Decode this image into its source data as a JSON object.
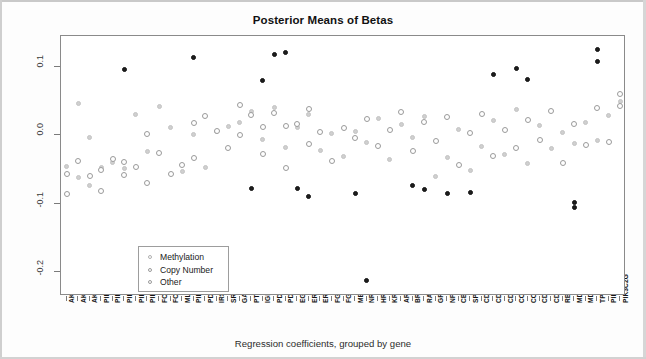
{
  "chart": {
    "title": "Posterior Means of Betas",
    "xlabel": "Regression coefficients, grouped by gene",
    "ylabel": "Posterior means"
  },
  "legend": {
    "items": [
      {
        "label": "Methylation",
        "key": "meth"
      },
      {
        "label": "Copy Number",
        "key": "cn"
      },
      {
        "label": "Other",
        "key": "other"
      }
    ]
  },
  "chart_data": {
    "type": "scatter",
    "title": "Posterior Means of Betas",
    "xlabel": "Regression coefficients, grouped by gene",
    "ylabel": "Posterior means",
    "ylim": [
      -0.235,
      0.145
    ],
    "yticks": [
      0.1,
      0.0,
      -0.1,
      -0.2
    ],
    "ytick_labels": [
      "0.1",
      "0.0",
      "-0.1",
      "-0.2"
    ],
    "grid": false,
    "legend_position": "lower left (inside axes)",
    "categories": [
      "AKT1",
      "AKT2",
      "AKT3",
      "PIK3CA",
      "PIK3CB",
      "PIK3CD",
      "PIK3R1",
      "PIK3R2",
      "FOXO1A",
      "FOXO3A",
      "MLLT7",
      "PIK3CG",
      "PDPK1",
      "IRS1",
      "SRC",
      "GAB1",
      "PTEN",
      "IGF1R",
      "PDGFRA",
      "PDGFRB",
      "EGFR",
      "ERBB2",
      "ERBB3",
      "FGFR1",
      "FGFR2",
      "MET",
      "NRAS",
      "HRAS",
      "KRAS",
      "ARAF",
      "BRAF",
      "RAF1",
      "GRB2",
      "NF1",
      "CBL",
      "SPRY2",
      "CDKN2A",
      "CDKN2C",
      "CDKN2B",
      "CCND1",
      "CCND2",
      "CDK4",
      "CDK6",
      "RB1",
      "MDM2",
      "MDM4",
      "TP53",
      "PIK3C2B",
      "PIK3C2G"
    ],
    "series": [
      {
        "name": "Methylation",
        "marker": "light-gray filled circle",
        "points": [
          {
            "gene": "AKT1",
            "x": 1,
            "y": -0.045
          },
          {
            "gene": "AKT2",
            "x": 2,
            "y": 0.046
          },
          {
            "gene": "AKT2",
            "x": 2,
            "y": -0.062
          },
          {
            "gene": "AKT3",
            "x": 3,
            "y": -0.003
          },
          {
            "gene": "AKT3",
            "x": 3,
            "y": -0.074
          },
          {
            "gene": "PIK3CA",
            "x": 4,
            "y": -0.047
          },
          {
            "gene": "PIK3CB",
            "x": 5,
            "y": -0.04
          },
          {
            "gene": "PIK3CD",
            "x": 6,
            "y": -0.049
          },
          {
            "gene": "PIK3R1",
            "x": 7,
            "y": 0.03
          },
          {
            "gene": "PIK3R2",
            "x": 8,
            "y": -0.024
          },
          {
            "gene": "FOXO1A",
            "x": 9,
            "y": 0.042
          },
          {
            "gene": "FOXO3A",
            "x": 10,
            "y": 0.012
          },
          {
            "gene": "MLLT7",
            "x": 11,
            "y": -0.053
          },
          {
            "gene": "PIK3CG",
            "x": 12,
            "y": 0.001
          },
          {
            "gene": "PDPK1",
            "x": 13,
            "y": -0.047
          },
          {
            "gene": "IRS1",
            "x": 14,
            "y": 0.005
          },
          {
            "gene": "SRC",
            "x": 15,
            "y": 0.013
          },
          {
            "gene": "GAB1",
            "x": 16,
            "y": 0.018
          },
          {
            "gene": "PTEN",
            "x": 17,
            "y": 0.035
          },
          {
            "gene": "IGF1R",
            "x": 18,
            "y": -0.006
          },
          {
            "gene": "PDGFRA",
            "x": 19,
            "y": 0.041
          },
          {
            "gene": "PDGFRB",
            "x": 20,
            "y": -0.018
          },
          {
            "gene": "EGFR",
            "x": 21,
            "y": 0.011
          },
          {
            "gene": "ERBB2",
            "x": 22,
            "y": 0.031
          },
          {
            "gene": "ERBB3",
            "x": 23,
            "y": -0.022
          },
          {
            "gene": "FGFR1",
            "x": 24,
            "y": 0.002
          },
          {
            "gene": "FGFR2",
            "x": 25,
            "y": -0.031
          },
          {
            "gene": "MET",
            "x": 26,
            "y": 0.006
          },
          {
            "gene": "NRAS",
            "x": 27,
            "y": -0.011
          },
          {
            "gene": "HRAS",
            "x": 28,
            "y": 0.024
          },
          {
            "gene": "KRAS",
            "x": 29,
            "y": -0.036
          },
          {
            "gene": "ARAF",
            "x": 30,
            "y": 0.015
          },
          {
            "gene": "BRAF",
            "x": 31,
            "y": -0.004
          },
          {
            "gene": "RAF1",
            "x": 32,
            "y": 0.027
          },
          {
            "gene": "GRB2",
            "x": 33,
            "y": -0.06
          },
          {
            "gene": "NF1",
            "x": 34,
            "y": -0.033
          },
          {
            "gene": "CBL",
            "x": 35,
            "y": 0.009
          },
          {
            "gene": "SPRY2",
            "x": 36,
            "y": -0.051
          },
          {
            "gene": "CDKN2A",
            "x": 37,
            "y": -0.016
          },
          {
            "gene": "CDKN2C",
            "x": 38,
            "y": 0.021
          },
          {
            "gene": "CDKN2B",
            "x": 39,
            "y": -0.028
          },
          {
            "gene": "CCND1",
            "x": 40,
            "y": 0.038
          },
          {
            "gene": "CCND2",
            "x": 41,
            "y": -0.042
          },
          {
            "gene": "CDK4",
            "x": 42,
            "y": 0.014
          },
          {
            "gene": "CDK6",
            "x": 43,
            "y": -0.02
          },
          {
            "gene": "RB1",
            "x": 44,
            "y": 0.004
          },
          {
            "gene": "MDM2",
            "x": 45,
            "y": -0.012
          },
          {
            "gene": "MDM4",
            "x": 46,
            "y": 0.019
          },
          {
            "gene": "TP53",
            "x": 47,
            "y": -0.008
          },
          {
            "gene": "PIK3C2B",
            "x": 48,
            "y": 0.029
          },
          {
            "gene": "PIK3C2G",
            "x": 49,
            "y": 0.049
          }
        ]
      },
      {
        "name": "Copy Number",
        "marker": "open circle with gray ring",
        "points": [
          {
            "gene": "AKT1",
            "x": 1,
            "y": -0.056
          },
          {
            "gene": "AKT1",
            "x": 1,
            "y": -0.086
          },
          {
            "gene": "AKT2",
            "x": 2,
            "y": -0.037
          },
          {
            "gene": "AKT3",
            "x": 3,
            "y": -0.06
          },
          {
            "gene": "PIK3CA",
            "x": 4,
            "y": -0.051
          },
          {
            "gene": "PIK3CA",
            "x": 4,
            "y": -0.081
          },
          {
            "gene": "PIK3CB",
            "x": 5,
            "y": -0.035
          },
          {
            "gene": "PIK3CD",
            "x": 6,
            "y": -0.058
          },
          {
            "gene": "PIK3CD",
            "x": 6,
            "y": -0.039
          },
          {
            "gene": "PIK3R1",
            "x": 7,
            "y": -0.047
          },
          {
            "gene": "PIK3R2",
            "x": 8,
            "y": 0.002
          },
          {
            "gene": "PIK3R2",
            "x": 8,
            "y": -0.07
          },
          {
            "gene": "FOXO1A",
            "x": 9,
            "y": -0.026
          },
          {
            "gene": "FOXO3A",
            "x": 10,
            "y": -0.056
          },
          {
            "gene": "MLLT7",
            "x": 11,
            "y": -0.044
          },
          {
            "gene": "PIK3CG",
            "x": 12,
            "y": 0.018
          },
          {
            "gene": "PIK3CG",
            "x": 12,
            "y": -0.034
          },
          {
            "gene": "PDPK1",
            "x": 13,
            "y": 0.028
          },
          {
            "gene": "IRS1",
            "x": 14,
            "y": 0.006
          },
          {
            "gene": "SRC",
            "x": 15,
            "y": -0.018
          },
          {
            "gene": "GAB1",
            "x": 16,
            "y": 0.044
          },
          {
            "gene": "GAB1",
            "x": 16,
            "y": 0.001
          },
          {
            "gene": "PTEN",
            "x": 17,
            "y": 0.03
          },
          {
            "gene": "IGF1R",
            "x": 18,
            "y": 0.012
          },
          {
            "gene": "IGF1R",
            "x": 18,
            "y": -0.027
          },
          {
            "gene": "PDGFRA",
            "x": 19,
            "y": 0.033
          },
          {
            "gene": "PDGFRB",
            "x": 20,
            "y": 0.013
          },
          {
            "gene": "PDGFRB",
            "x": 20,
            "y": -0.048
          },
          {
            "gene": "EGFR",
            "x": 21,
            "y": 0.016
          },
          {
            "gene": "ERBB2",
            "x": 22,
            "y": 0.038
          },
          {
            "gene": "ERBB2",
            "x": 22,
            "y": -0.013
          },
          {
            "gene": "ERBB3",
            "x": 23,
            "y": 0.005
          },
          {
            "gene": "FGFR1",
            "x": 24,
            "y": -0.038
          },
          {
            "gene": "FGFR2",
            "x": 25,
            "y": 0.01
          },
          {
            "gene": "MET",
            "x": 26,
            "y": -0.004
          },
          {
            "gene": "NRAS",
            "x": 27,
            "y": 0.024
          },
          {
            "gene": "HRAS",
            "x": 28,
            "y": -0.016
          },
          {
            "gene": "KRAS",
            "x": 29,
            "y": 0.008
          },
          {
            "gene": "ARAF",
            "x": 30,
            "y": 0.034
          },
          {
            "gene": "BRAF",
            "x": 31,
            "y": -0.023
          },
          {
            "gene": "RAF1",
            "x": 32,
            "y": 0.02
          },
          {
            "gene": "GRB2",
            "x": 33,
            "y": -0.009
          },
          {
            "gene": "NF1",
            "x": 34,
            "y": 0.026
          },
          {
            "gene": "CBL",
            "x": 35,
            "y": -0.044
          },
          {
            "gene": "SPRY2",
            "x": 36,
            "y": 0.003
          },
          {
            "gene": "CDKN2A",
            "x": 37,
            "y": 0.031
          },
          {
            "gene": "CDKN2C",
            "x": 38,
            "y": -0.03
          },
          {
            "gene": "CDKN2B",
            "x": 39,
            "y": 0.007
          },
          {
            "gene": "CCND1",
            "x": 40,
            "y": -0.019
          },
          {
            "gene": "CCND2",
            "x": 41,
            "y": 0.022
          },
          {
            "gene": "CDK4",
            "x": 42,
            "y": -0.007
          },
          {
            "gene": "CDK6",
            "x": 43,
            "y": 0.036
          },
          {
            "gene": "RB1",
            "x": 44,
            "y": -0.041
          },
          {
            "gene": "MDM2",
            "x": 45,
            "y": 0.017
          },
          {
            "gene": "MDM4",
            "x": 46,
            "y": -0.014
          },
          {
            "gene": "TP53",
            "x": 47,
            "y": 0.04
          },
          {
            "gene": "PIK3C2B",
            "x": 48,
            "y": -0.01
          },
          {
            "gene": "PIK3C2G",
            "x": 49,
            "y": 0.06
          },
          {
            "gene": "PIK3C2G",
            "x": 49,
            "y": 0.043
          }
        ]
      },
      {
        "name": "Other",
        "marker": "dark filled circle",
        "points": [
          {
            "gene": "PIK3CD",
            "x": 6,
            "y": 0.096
          },
          {
            "gene": "PIK3CG",
            "x": 12,
            "y": 0.113
          },
          {
            "gene": "PTEN",
            "x": 17,
            "y": -0.078
          },
          {
            "gene": "IGF1R",
            "x": 18,
            "y": 0.08
          },
          {
            "gene": "PDGFRA",
            "x": 19,
            "y": 0.118
          },
          {
            "gene": "PDGFRB",
            "x": 20,
            "y": 0.121
          },
          {
            "gene": "EGFR",
            "x": 21,
            "y": -0.078
          },
          {
            "gene": "ERBB2",
            "x": 22,
            "y": -0.089
          },
          {
            "gene": "MET",
            "x": 26,
            "y": -0.085
          },
          {
            "gene": "NRAS",
            "x": 27,
            "y": -0.212
          },
          {
            "gene": "BRAF",
            "x": 31,
            "y": -0.073
          },
          {
            "gene": "RAF1",
            "x": 32,
            "y": -0.08
          },
          {
            "gene": "NF1",
            "x": 34,
            "y": -0.085
          },
          {
            "gene": "SPRY2",
            "x": 36,
            "y": -0.083
          },
          {
            "gene": "CDKN2C",
            "x": 38,
            "y": 0.089
          },
          {
            "gene": "CCND1",
            "x": 40,
            "y": 0.097
          },
          {
            "gene": "CCND2",
            "x": 41,
            "y": 0.081
          },
          {
            "gene": "MDM2",
            "x": 45,
            "y": -0.098
          },
          {
            "gene": "MDM2",
            "x": 45,
            "y": -0.105
          },
          {
            "gene": "TP53",
            "x": 47,
            "y": 0.126
          },
          {
            "gene": "TP53",
            "x": 47,
            "y": 0.108
          }
        ]
      }
    ]
  }
}
